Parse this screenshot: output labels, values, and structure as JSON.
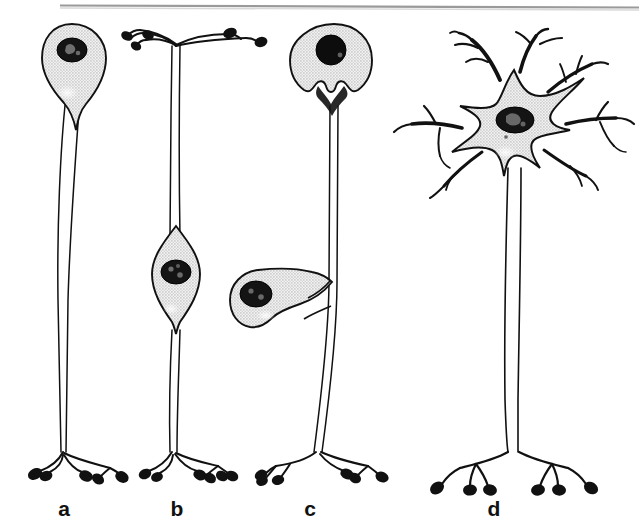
{
  "figure": {
    "background_color": "#ffffff",
    "top_rule": {
      "name": "horizontal-rule",
      "color": "#9a9a9a",
      "x_start": 60,
      "x_end": 639,
      "y": 5,
      "thickness": 2
    },
    "ink_color": "#111111",
    "soma_fill_color": "#dcdcdc",
    "nucleus_color": "#111111",
    "terminal_bouton_color": "#111111"
  },
  "panels": [
    {
      "id": "a",
      "label": "a",
      "label_x": 64,
      "label_y": 510,
      "neuron_type": "unipolar",
      "soma_shape": "pear-teardrop",
      "soma_position": "top",
      "soma_center_x": 72,
      "soma_center_y": 58,
      "nucleus_style": "stippled-dark",
      "dendrites": 0,
      "axon_terminal_boutons": 4,
      "axon_length_px": 370
    },
    {
      "id": "b",
      "label": "b",
      "label_x": 177,
      "label_y": 510,
      "neuron_type": "bipolar",
      "soma_shape": "spindle-fusiform",
      "soma_position": "middle",
      "soma_center_x": 176,
      "soma_center_y": 270,
      "nucleus_style": "stippled-dark",
      "dendrites": 5,
      "dendrite_terminal_boutons": 5,
      "axon_terminal_boutons": 5,
      "axon_length_px": 430
    },
    {
      "id": "c",
      "label": "c",
      "label_x": 310,
      "label_y": 510,
      "neuron_type": "pseudounipolar",
      "soma_shape": "round-with-notch",
      "soma_position": "offset-left-mid",
      "soma_center_x": 272,
      "soma_center_y": 272,
      "secondary_soma_center_x": 334,
      "secondary_soma_center_y": 55,
      "nucleus_style": "solid-dark",
      "dendrites": 0,
      "axon_terminal_boutons": 6,
      "axon_length_px": 400
    },
    {
      "id": "d",
      "label": "d",
      "label_x": 494,
      "label_y": 510,
      "neuron_type": "multipolar",
      "soma_shape": "stellate-star",
      "soma_position": "top",
      "soma_center_x": 515,
      "soma_center_y": 125,
      "nucleus_style": "stippled-dark",
      "dendrites": 7,
      "axon_terminal_boutons": 6,
      "axon_length_px": 320
    }
  ],
  "labels": {
    "a": "a",
    "b": "b",
    "c": "c",
    "d": "d"
  }
}
